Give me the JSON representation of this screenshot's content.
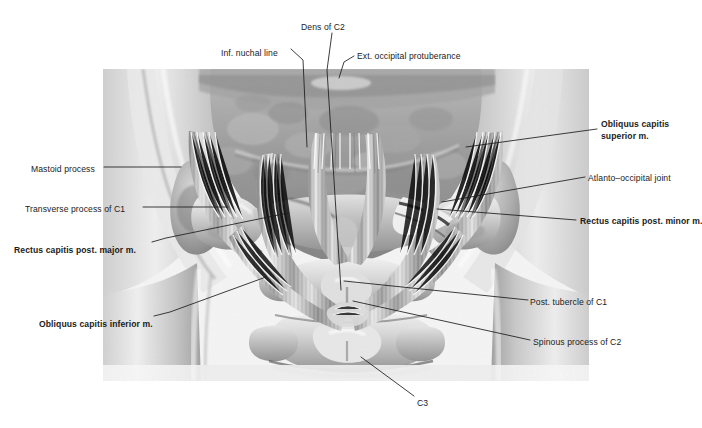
{
  "figure": {
    "background_color": "#ffffff",
    "ink_color": "#1b1b1b"
  },
  "labels": [
    {
      "id": "dens-of-c2",
      "text": "Dens of C2",
      "bold": false,
      "x": 301,
      "y": 22,
      "align": "left"
    },
    {
      "id": "inf-nuchal-line",
      "text": "Inf. nuchal line",
      "bold": false,
      "x": 221,
      "y": 48,
      "align": "left"
    },
    {
      "id": "ext-occipital-protuberance",
      "text": "Ext. occipital protuberance",
      "bold": false,
      "x": 357,
      "y": 51,
      "align": "left"
    },
    {
      "id": "obliquus-capitis-superior",
      "text": "Obliquus capitis",
      "bold": true,
      "x": 601,
      "y": 119,
      "align": "left"
    },
    {
      "id": "obliquus-capitis-superior2",
      "text": "superior m.",
      "bold": true,
      "x": 601,
      "y": 131,
      "align": "left"
    },
    {
      "id": "mastoid-process",
      "text": "Mastoid process",
      "bold": false,
      "x": 31,
      "y": 164,
      "align": "left"
    },
    {
      "id": "atlanto-occipital-joint",
      "text": "Atlanto–occipital joint",
      "bold": false,
      "x": 588,
      "y": 173,
      "align": "left"
    },
    {
      "id": "transverse-process-of-c1",
      "text": "Transverse process of C1",
      "bold": false,
      "x": 25,
      "y": 204,
      "align": "left"
    },
    {
      "id": "rectus-capitis-post-minor",
      "text": "Rectus capitis post. minor m.",
      "bold": true,
      "x": 580,
      "y": 216,
      "align": "left"
    },
    {
      "id": "rectus-capitis-post-major",
      "text": "Rectus capitis post. major m.",
      "bold": true,
      "x": 14,
      "y": 245,
      "align": "left"
    },
    {
      "id": "post-tubercle-of-c1",
      "text": "Post. tubercle of C1",
      "bold": false,
      "x": 530,
      "y": 297,
      "align": "left"
    },
    {
      "id": "obliquus-capitis-inferior",
      "text": "Obliquus capitis inferior m.",
      "bold": true,
      "x": 39,
      "y": 319,
      "align": "left"
    },
    {
      "id": "spinous-process-of-c2",
      "text": "Spinous process of C2",
      "bold": false,
      "x": 533,
      "y": 337,
      "align": "left"
    },
    {
      "id": "c3",
      "text": "C3",
      "bold": false,
      "x": 417,
      "y": 398,
      "align": "left"
    }
  ],
  "leader_lines": [
    {
      "id": "leader-dens-of-c2",
      "points": "332,33 327,70 341,290"
    },
    {
      "id": "leader-inf-nuchal-line",
      "points": "291,49 303,60 307,147"
    },
    {
      "id": "leader-ext-occipital-protuberance",
      "points": "354,56 344,62 339,78"
    },
    {
      "id": "leader-obliquus-capitis-superior",
      "points": "597,129 466,147"
    },
    {
      "id": "leader-mastoid-process",
      "points": "104,167 181,167"
    },
    {
      "id": "leader-atlanto-occipital-joint",
      "points": "585,177 442,202"
    },
    {
      "id": "leader-transverse-process-of-c1",
      "points": "143,207 228,207"
    },
    {
      "id": "leader-rectus-capitis-post-minor",
      "points": "576,220 437,209"
    },
    {
      "id": "leader-rectus-capitis-post-major",
      "points": "152,242 166,238 288,213"
    },
    {
      "id": "leader-post-tubercle-of-c1",
      "points": "528,300 344,281"
    },
    {
      "id": "leader-obliquus-capitis-inferior",
      "points": "154,316 170,312 266,277"
    },
    {
      "id": "leader-spinous-process-of-c2",
      "points": "530,340 353,301"
    },
    {
      "id": "leader-c3",
      "points": "414,396 361,357"
    }
  ],
  "plate": {
    "x": 103,
    "y": 69,
    "width": 486,
    "height": 312
  }
}
